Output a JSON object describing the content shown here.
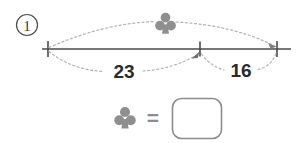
{
  "page": {
    "background_color": "#ffffff",
    "width": 308,
    "height": 143
  },
  "question": {
    "number_label": "1",
    "number_badge_name": "circled-number-one"
  },
  "number_line": {
    "axis_color": "#4a4a4a",
    "tick_color": "#4a4a4a",
    "guide_color": "#b0b0b0",
    "ticks": [
      {
        "id": "left-endpoint",
        "x": 48,
        "label": ""
      },
      {
        "id": "middle-point",
        "x": 200,
        "label": ""
      },
      {
        "id": "right-endpoint",
        "x": 277,
        "label": ""
      }
    ],
    "segments": [
      {
        "id": "left-segment",
        "label": "23",
        "from": "left-endpoint",
        "to": "middle-point"
      },
      {
        "id": "right-segment",
        "label": "16",
        "from": "middle-point",
        "to": "right-endpoint"
      }
    ],
    "total_span": {
      "id": "total-span",
      "label_symbol": "club",
      "from": "left-endpoint",
      "to": "right-endpoint"
    }
  },
  "symbols": {
    "club": {
      "name": "club-symbol",
      "glyph": "♣",
      "color": "#8f8f8f"
    }
  },
  "equation": {
    "left_symbol": "club",
    "operator": "=",
    "answer_value": "",
    "answer_placeholder": "",
    "box_color": "#8c8c8c"
  },
  "labels": {
    "left_length": "23",
    "right_length": "16",
    "question_number": "1",
    "equals": "="
  }
}
